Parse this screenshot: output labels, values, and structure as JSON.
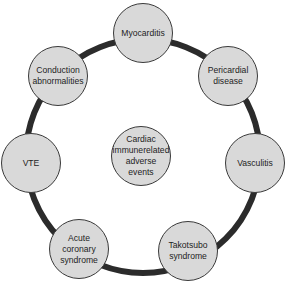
{
  "diagram": {
    "type": "hub-and-ring",
    "center": {
      "label": "Cardiac\nimmunerelated\nadverse\nevents",
      "x": 141,
      "y": 156
    },
    "ring": {
      "cx": 143,
      "cy": 155,
      "r": 118,
      "stroke": "#2b2b2b",
      "stroke_width": 6
    },
    "node_fill": "#d9d9d9",
    "nodes": [
      {
        "label": "Myocarditis",
        "x": 143,
        "y": 33
      },
      {
        "label": "Pericardial\ndisease",
        "x": 228,
        "y": 76
      },
      {
        "label": "Vasculitis",
        "x": 255,
        "y": 163
      },
      {
        "label": "Takotsubo\nsyndrome",
        "x": 188,
        "y": 251
      },
      {
        "label": "Acute\ncoronary\nsyndrome",
        "x": 79,
        "y": 249
      },
      {
        "label": "VTE",
        "x": 31,
        "y": 163
      },
      {
        "label": "Conduction\nabnormalities",
        "x": 58,
        "y": 76
      }
    ]
  }
}
